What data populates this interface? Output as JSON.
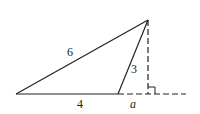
{
  "diagram": {
    "type": "geometry-triangle",
    "points": {
      "left_base": [
        16,
        94
      ],
      "mid_base": [
        118,
        94
      ],
      "apex": [
        148,
        20
      ],
      "foot": [
        148,
        94
      ],
      "dash_end": [
        186,
        94
      ]
    },
    "labels": {
      "side_long": "6",
      "side_short": "3",
      "base_segment": "4",
      "extension": "a"
    },
    "right_angle_marker": true,
    "stroke_color": "#222222"
  }
}
